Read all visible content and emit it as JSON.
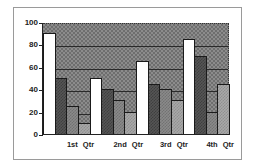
{
  "chart_data": {
    "type": "bar",
    "title": "",
    "xlabel": "",
    "ylabel": "",
    "ylim": [
      0,
      100
    ],
    "yticks": [
      0,
      20,
      40,
      60,
      80,
      100
    ],
    "grid": true,
    "legend": null,
    "categories": [
      "1st  Qtr",
      "2nd  Qtr",
      "3rd  Qtr",
      "4th  Qtr"
    ],
    "series": [
      {
        "name": "Series 1",
        "fill": "#ffffff",
        "values": [
          90,
          50,
          65,
          85
        ]
      },
      {
        "name": "Series 2",
        "fill": "#555555",
        "values": [
          50,
          40,
          45,
          70
        ]
      },
      {
        "name": "Series 3",
        "fill": "#8a8a8a",
        "values": [
          25,
          30,
          40,
          20
        ]
      },
      {
        "name": "Series 4",
        "fill": "#a8a8a8",
        "values": [
          10,
          20,
          30,
          45
        ]
      }
    ]
  }
}
